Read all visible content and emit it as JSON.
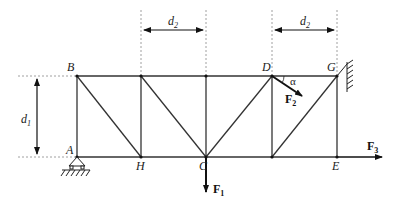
{
  "diagram": {
    "type": "truss",
    "nodes": {
      "A": {
        "label": "A"
      },
      "B": {
        "label": "B"
      },
      "H": {
        "label": "H"
      },
      "C": {
        "label": "C"
      },
      "D": {
        "label": "D"
      },
      "G": {
        "label": "G"
      },
      "E": {
        "label": "E"
      }
    },
    "dimensions": {
      "d1": {
        "base": "d",
        "sub": "1"
      },
      "d2_left": {
        "base": "d",
        "sub": "2"
      },
      "d2_right": {
        "base": "d",
        "sub": "2"
      }
    },
    "forces": {
      "F1": {
        "base": "F",
        "sub": "1"
      },
      "F2": {
        "base": "F",
        "sub": "2"
      },
      "F3": {
        "base": "F",
        "sub": "3"
      }
    },
    "angle": {
      "label": "α"
    }
  }
}
